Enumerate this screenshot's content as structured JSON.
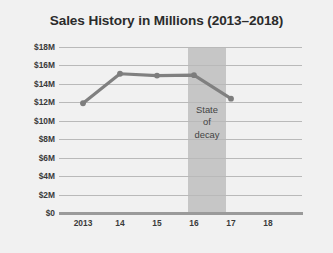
{
  "chart_data": {
    "type": "line",
    "title": "Sales History in Millions (2013–2018)",
    "xlabel": "",
    "ylabel": "",
    "categories": [
      "2013",
      "14",
      "15",
      "16",
      "17",
      "18"
    ],
    "series": [
      {
        "name": "Sales",
        "values": [
          11.9,
          15.1,
          14.9,
          14.95,
          12.4,
          null
        ]
      }
    ],
    "ylim": [
      0,
      18
    ],
    "ytick_values": [
      0,
      2,
      4,
      6,
      8,
      10,
      12,
      14,
      16,
      18
    ],
    "ytick_labels": [
      "$0",
      "$2M",
      "$4M",
      "$6M",
      "$8M",
      "$10M",
      "$12M",
      "$14M",
      "$16M",
      "$18M"
    ],
    "xtick_labels": [
      "2013",
      "14",
      "15",
      "16",
      "17",
      "18"
    ],
    "grid": "horizontal",
    "legend": "none",
    "annotations": [
      {
        "name": "state-of-decay",
        "text_lines": [
          "State",
          "of",
          "decay"
        ],
        "text": "State of decay",
        "type": "shaded-band",
        "x_start": "16",
        "x_end": "17"
      }
    ],
    "colors": {
      "background": "#f1f1f1",
      "line": "#808080",
      "marker": "#7d7d7d",
      "gridline": "#b9b9b9",
      "axis": "#9a9a9a",
      "band": "#c6c6c6",
      "title_text": "#2b2b2b",
      "tick_text": "#3a3a3a",
      "annotation_text": "#444444"
    }
  }
}
